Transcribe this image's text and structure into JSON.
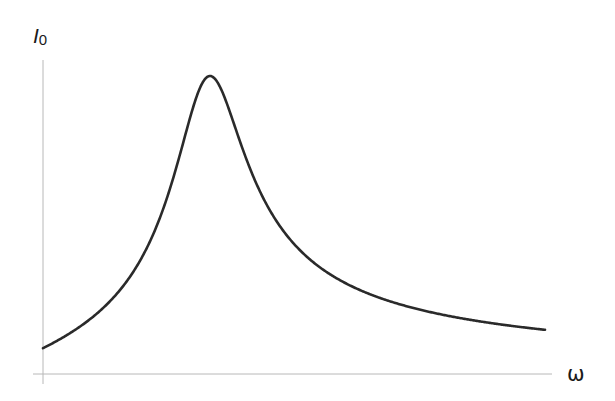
{
  "chart_data": {
    "type": "line",
    "title": "",
    "xlabel": "ω",
    "ylabel": "I",
    "ylabel_subscript": "0",
    "grid": false,
    "ticks": false,
    "legend": null,
    "axis_color": "#b0b0b0",
    "line_color": "#2a2a2a",
    "x_range": [
      0,
      3.0
    ],
    "y_range": [
      0,
      1.05
    ],
    "peak": {
      "x": 1.0,
      "y": 1.0
    },
    "series": [
      {
        "name": "I0(ω)",
        "model": "1/sqrt(1 + Q^2*(w - 1/w)^2)",
        "Q": 3.2,
        "x": [
          0.0,
          0.1,
          0.2,
          0.3,
          0.4,
          0.5,
          0.6,
          0.7,
          0.8,
          0.9,
          0.95,
          1.0,
          1.05,
          1.1,
          1.2,
          1.3,
          1.4,
          1.5,
          1.6,
          1.8,
          2.0,
          2.2,
          2.5,
          2.8,
          3.0
        ],
        "values": [
          0.04,
          0.06,
          0.07,
          0.09,
          0.13,
          0.2,
          0.29,
          0.41,
          0.6,
          0.85,
          0.95,
          1.0,
          0.96,
          0.86,
          0.63,
          0.46,
          0.36,
          0.29,
          0.25,
          0.19,
          0.16,
          0.13,
          0.11,
          0.09,
          0.08
        ]
      }
    ]
  },
  "labels": {
    "y_main": "I",
    "y_sub": "0",
    "x": "ω"
  }
}
